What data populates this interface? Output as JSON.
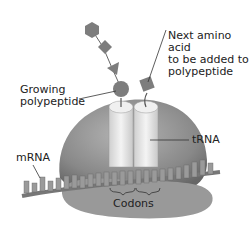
{
  "labels": {
    "growing_polypeptide": [
      "Growing",
      "polypeptide"
    ],
    "next_amino_acid": [
      "Next amino acid",
      "to be added to",
      "polypeptide"
    ],
    "trna": "tRNA",
    "mrna": "mRNA",
    "codons": "Codons"
  },
  "colors": {
    "ribosome": "#8a8a8a",
    "ribosome_dark": "#6a6a6a",
    "trna": "#e4e4e4",
    "amino_acid": "#7d7d7d",
    "mrna": "#8c8c8c",
    "text": "#222222"
  }
}
